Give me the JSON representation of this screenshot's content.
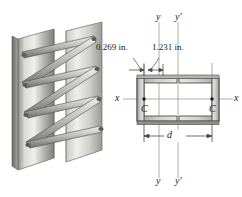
{
  "figure": {
    "background": "#ffffff"
  },
  "pictorial": {
    "name": "laced-built-up-column",
    "description": "Vertical built-up column with zigzag lacing bars",
    "colors": {
      "plate_light": "#e8e8e6",
      "plate_mid": "#b9b9b5",
      "plate_dark": "#8d8d89",
      "bar_light": "#d6d6d2",
      "bar_dark": "#6f6f6b",
      "outline": "#4a4a47"
    }
  },
  "section": {
    "dimensions": [
      {
        "id": "d1",
        "label": "0.269 in."
      },
      {
        "id": "d2",
        "label": "1.231 in."
      },
      {
        "id": "d3",
        "label": "d"
      }
    ],
    "axes": [
      {
        "id": "y-top-left",
        "label": "y"
      },
      {
        "id": "y-top-right",
        "label": "y′"
      },
      {
        "id": "y-bot-left",
        "label": "y"
      },
      {
        "id": "y-bot-right",
        "label": "y′"
      },
      {
        "id": "x-left",
        "label": "x"
      },
      {
        "id": "x-right",
        "label": "x"
      }
    ],
    "centroids": [
      {
        "id": "centroid-left",
        "label": "C"
      },
      {
        "id": "centroid-right",
        "label": "C"
      }
    ],
    "colors": {
      "steel_face": "#c9c9c5",
      "steel_shade": "#9c9c98",
      "steel_light": "#e0e0dd",
      "outline": "#3a3a38",
      "axis_line": "#8a8a86",
      "dim_line": "#6a6a66",
      "text": "#1a1a1a"
    }
  }
}
